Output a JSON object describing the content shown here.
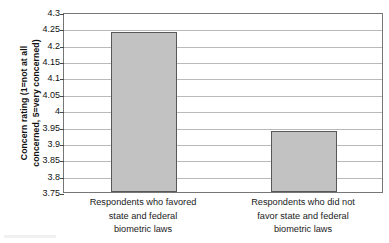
{
  "chart_data": {
    "type": "bar",
    "title": "",
    "xlabel": "",
    "ylabel": "Concern rating (1 = not at all concerned, 5 = very concerned)",
    "ylabel_lines": [
      "Concern rating (1=not at all",
      "concerned, 5=very concerned)"
    ],
    "categories": [
      "Respondents who favored state and federal biometric laws",
      "Respondents who did not favor state and federal biometric laws"
    ],
    "category_lines": [
      [
        "Respondents who favored",
        "state and federal",
        "biometric laws"
      ],
      [
        "Respondents who did not",
        "favor state and federal",
        "biometric laws"
      ]
    ],
    "values": [
      4.238,
      3.936
    ],
    "ylim": [
      3.75,
      4.3
    ],
    "ytick_step": 0.05,
    "yticks": [
      4.3,
      4.25,
      4.2,
      4.15,
      4.1,
      4.05,
      4,
      3.95,
      3.9,
      3.85,
      3.8,
      3.75
    ],
    "ytick_labels": [
      "4.3",
      "4.25",
      "4.2",
      "4.15",
      "4.1",
      "4.05",
      "4",
      "3.95",
      "3.9",
      "3.85",
      "3.8",
      "3.75"
    ],
    "grid": true,
    "legend": false,
    "legend_position": "none",
    "colors": {
      "bar_fill": "#c2c2c2",
      "bar_border": "#585858",
      "gridline": "#b9b9b9",
      "plot_border": "#767676",
      "text": "#1a1a1a",
      "background": "#ffffff"
    }
  }
}
